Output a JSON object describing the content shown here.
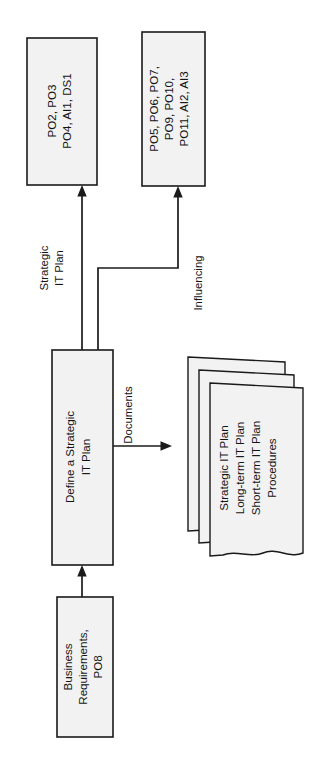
{
  "diagram": {
    "orientation": "rotated-90-ccw",
    "colors": {
      "box_fill": "#f2f2f2",
      "stroke": "#1a1a1a",
      "background": "#ffffff"
    },
    "nodes": {
      "output_box_1": {
        "name": "outputs-box-1",
        "lines": [
          "PO2, PO3",
          "PO4, AI1, DS1"
        ]
      },
      "output_box_2": {
        "name": "outputs-box-2",
        "lines": [
          "PO5, PO6, PO7,",
          "PO9, PO10,",
          "PO11, AI2, AI3"
        ]
      },
      "process_box": {
        "name": "process-define-strategic-it-plan",
        "lines": [
          "Define a Strategic",
          "IT Plan"
        ]
      },
      "input_box": {
        "name": "inputs-business-requirements",
        "lines": [
          "Business",
          "Requirements,",
          "PO8"
        ]
      },
      "document_stack": {
        "name": "documents-stack",
        "lines": [
          "Strategic IT Plan",
          "Long-term IT Plan",
          "Short-term IT Plan",
          "Procedures"
        ]
      }
    },
    "edge_labels": {
      "strategic_it_plan": [
        "Strategic",
        "IT Plan"
      ],
      "influencing": [
        "Influencing"
      ],
      "documents": [
        "Documents"
      ]
    }
  }
}
